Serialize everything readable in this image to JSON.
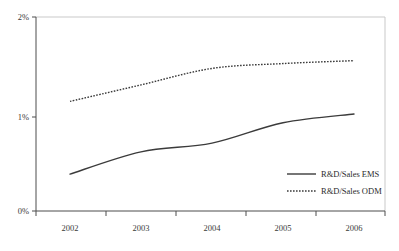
{
  "chart_data": {
    "type": "line",
    "title": "",
    "subtitle": "",
    "xlabel": "",
    "ylabel": "",
    "categories": [
      "2002",
      "2003",
      "2004",
      "2005",
      "2006"
    ],
    "series": [
      {
        "name": "R&D/Sales EMS",
        "style": "solid",
        "values": [
          0.38,
          0.61,
          0.7,
          0.91,
          1.0
        ]
      },
      {
        "name": "R&D/Sales ODM",
        "style": "dotted",
        "values": [
          1.13,
          1.3,
          1.47,
          1.52,
          1.55
        ]
      }
    ],
    "ylim": [
      0,
      2
    ],
    "y_ticks": [
      0,
      1,
      2
    ],
    "y_tick_labels": [
      "0%",
      "1%",
      "2%"
    ],
    "grid": false,
    "legend_position": "inside-bottom-right",
    "units": "percent"
  },
  "axes": {
    "y_labels": [
      "2%",
      "1%",
      "0%"
    ],
    "x_labels": [
      "2002",
      "2003",
      "2004",
      "2005",
      "2006"
    ]
  },
  "legend": {
    "entries": [
      {
        "label": "R&D/Sales EMS",
        "style": "solid"
      },
      {
        "label": "R&D/Sales ODM",
        "style": "dotted"
      }
    ]
  },
  "colors": {
    "line": "#3b3b3b",
    "axis": "#4d4d4d",
    "frame": "#c9c9c9",
    "text": "#3a3a3a",
    "background": "#ffffff"
  }
}
